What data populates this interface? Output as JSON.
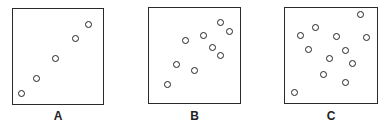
{
  "chart_data": [
    {
      "type": "scatter",
      "title": "A",
      "label": "A",
      "xlabel": "",
      "ylabel": "",
      "xlim": [
        0,
        100
      ],
      "ylim": [
        0,
        100
      ],
      "grid": false,
      "description": "Strong positive correlation",
      "points": [
        [
          10,
          10
        ],
        [
          26,
          26
        ],
        [
          48,
          47
        ],
        [
          70,
          69
        ],
        [
          85,
          83
        ]
      ]
    },
    {
      "type": "scatter",
      "title": "B",
      "label": "B",
      "xlabel": "",
      "ylabel": "",
      "xlim": [
        0,
        100
      ],
      "ylim": [
        0,
        100
      ],
      "grid": false,
      "description": "Moderate positive correlation",
      "points": [
        [
          21,
          19
        ],
        [
          30,
          40
        ],
        [
          40,
          65
        ],
        [
          50,
          34
        ],
        [
          60,
          71
        ],
        [
          70,
          58
        ],
        [
          79,
          49
        ],
        [
          79,
          85
        ],
        [
          89,
          75
        ]
      ]
    },
    {
      "type": "scatter",
      "title": "C",
      "label": "C",
      "xlabel": "",
      "ylabel": "",
      "xlim": [
        0,
        100
      ],
      "ylim": [
        0,
        100
      ],
      "grid": false,
      "description": "No correlation",
      "points": [
        [
          10,
          10
        ],
        [
          17,
          71
        ],
        [
          26,
          56
        ],
        [
          33,
          79
        ],
        [
          42,
          29
        ],
        [
          49,
          46
        ],
        [
          57,
          70
        ],
        [
          66,
          55
        ],
        [
          67,
          21
        ],
        [
          74,
          41
        ],
        [
          83,
          93
        ],
        [
          90,
          69
        ]
      ]
    }
  ],
  "panels": [
    {
      "label": "A",
      "box": {
        "left": 12,
        "top": 8,
        "width": 92,
        "height": 97
      }
    },
    {
      "label": "B",
      "box": {
        "left": 148,
        "top": 7,
        "width": 93,
        "height": 97
      }
    },
    {
      "label": "C",
      "box": {
        "left": 284,
        "top": 7,
        "width": 94,
        "height": 97
      }
    }
  ],
  "colors": {
    "stroke": "#222222",
    "background": "#ffffff"
  }
}
